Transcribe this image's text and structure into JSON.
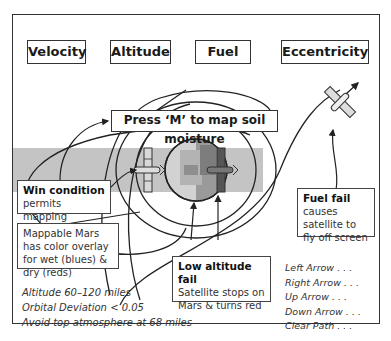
{
  "hud": {
    "items": [
      {
        "label": "Velocity"
      },
      {
        "label": "Altitude"
      },
      {
        "label": "Fuel"
      },
      {
        "label": "Eccentricity"
      }
    ]
  },
  "prompt": {
    "label": "Press ‘M’ to map soil moisture"
  },
  "callouts": {
    "win": {
      "title": "Win condition",
      "body": "permits mapping"
    },
    "mappable": {
      "body": "Mappable Mars has color overlay for wet (blues) & dry (reds)"
    },
    "low_alt": {
      "title": "Low altitude fail",
      "body": "Satellite stops on Mars & turns red"
    },
    "fuel": {
      "title": "Fuel fail",
      "body": "causes satellite to fly off screen"
    }
  },
  "constraints": {
    "lines": [
      "Altitude 60–120 miles",
      "Orbital Deviation < 0.05",
      "Avoid top atmosphere at 68 miles"
    ]
  },
  "controls": {
    "lines": [
      "Left Arrow . . .",
      "Right Arrow . . .",
      "Up Arrow . . .",
      "Down Arrow . . .",
      "Clear Path . . ."
    ]
  },
  "icons": {
    "planet": "mars-planet-icon",
    "satellite": "satellite-icon"
  },
  "colors": {
    "band": "#c4c4c4",
    "outline": "#333333",
    "planet_light": "#cfcfcf",
    "planet_dark": "#8a8a8a",
    "satellite_dark": "#555555"
  }
}
